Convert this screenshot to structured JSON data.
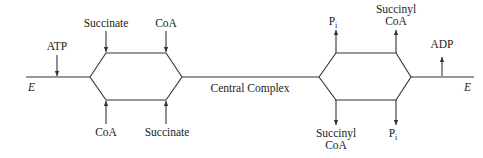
{
  "diagram": {
    "center_label": "Central Complex",
    "enzyme_left": "E",
    "enzyme_right": "E",
    "left_input": "ATP",
    "right_output": "ADP",
    "left_hexagon": {
      "top_left_in": "Succinate",
      "top_right_in": "CoA",
      "bottom_left_in": "CoA",
      "bottom_right_in": "Succinate"
    },
    "right_hexagon": {
      "top_left_out": "P",
      "top_left_out_sub": "i",
      "top_right_out_line1": "Succinyl",
      "top_right_out_line2": "CoA",
      "bottom_left_out_line1": "Succinyl",
      "bottom_left_out_line2": "CoA",
      "bottom_right_out": "P",
      "bottom_right_out_sub": "i"
    },
    "colors": {
      "line": "#333333",
      "text": "#222222",
      "background": "#ffffff"
    }
  }
}
